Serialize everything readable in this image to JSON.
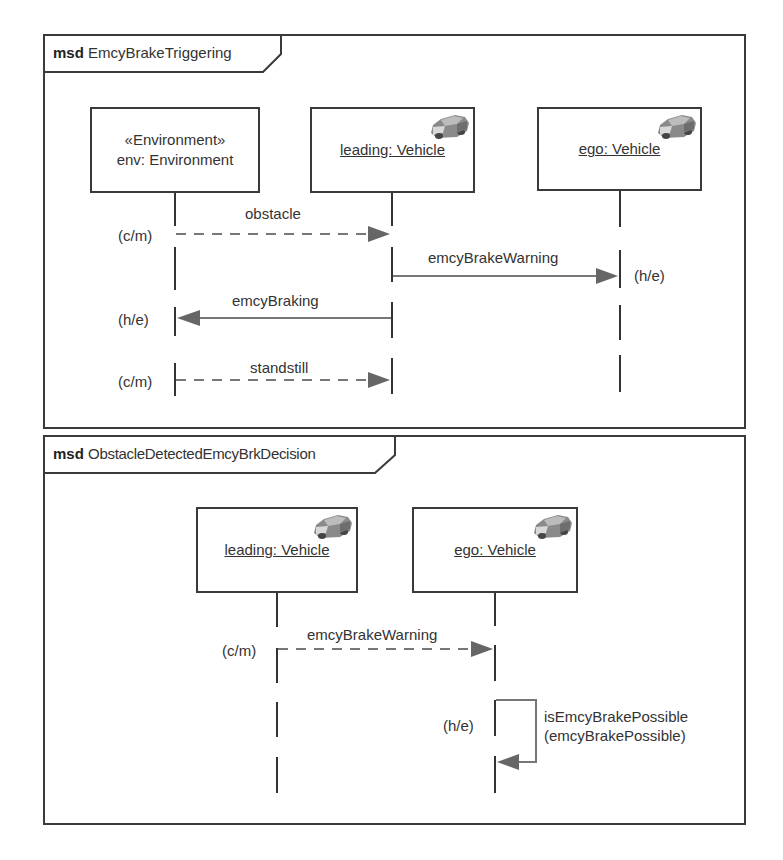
{
  "diagrams": [
    {
      "keyword": "msd",
      "name": "EmcyBrakeTriggering",
      "lifelines": [
        {
          "stereotype": "«Environment»",
          "label": "env: Environment",
          "underlined": false,
          "icon": null
        },
        {
          "label": "leading: Vehicle",
          "underlined": true,
          "icon": "car-icon"
        },
        {
          "label": "ego: Vehicle",
          "underlined": true,
          "icon": "car-icon"
        }
      ],
      "messages": [
        {
          "label": "obstacle",
          "from": "env: Environment",
          "to": "leading: Vehicle",
          "style": "dashed",
          "mode": "(c/m)"
        },
        {
          "label": "emcyBrakeWarning",
          "from": "leading: Vehicle",
          "to": "ego: Vehicle",
          "style": "solid",
          "mode": "(h/e)"
        },
        {
          "label": "emcyBraking",
          "from": "leading: Vehicle",
          "to": "env: Environment",
          "style": "solid",
          "mode": "(h/e)"
        },
        {
          "label": "standstill",
          "from": "env: Environment",
          "to": "leading: Vehicle",
          "style": "dashed",
          "mode": "(c/m)"
        }
      ]
    },
    {
      "keyword": "msd",
      "name": "ObstacleDetectedEmcyBrkDecision",
      "lifelines": [
        {
          "label": "leading: Vehicle",
          "underlined": true,
          "icon": "car-icon"
        },
        {
          "label": "ego: Vehicle",
          "underlined": true,
          "icon": "car-icon"
        }
      ],
      "messages": [
        {
          "label": "emcyBrakeWarning",
          "from": "leading: Vehicle",
          "to": "ego: Vehicle",
          "style": "dashed",
          "mode": "(c/m)"
        },
        {
          "label_line1": "isEmcyBrakePossible",
          "label_line2": "(emcyBrakePossible)",
          "from": "ego: Vehicle",
          "to": "ego: Vehicle",
          "style": "solid",
          "mode": "(h/e)",
          "self": true
        }
      ]
    }
  ],
  "colors": {
    "border": "#3a3a3a",
    "arrow": "#666666",
    "text": "#333333"
  }
}
